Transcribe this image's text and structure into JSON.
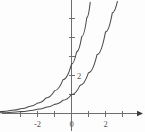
{
  "figure": {
    "title": "",
    "background_color": "#fdfdfd",
    "width": 145,
    "height": 132
  },
  "colors": {
    "axis": "#6e6e6e",
    "curve": "#4a4a4a",
    "label": "#555555",
    "arrow": "#3c3c3c"
  },
  "chart_data": {
    "type": "line",
    "title": "",
    "xlabel": "",
    "ylabel": "",
    "grid": false,
    "legend": "none",
    "xlim": [
      -4.2,
      4.3
    ],
    "ylim": [
      -0.95,
      5.95
    ],
    "x_ticks": [
      -3,
      -2,
      -1,
      0,
      1,
      2,
      3
    ],
    "x_tick_labels": [
      "",
      "-2",
      "",
      "0",
      "",
      "2",
      ""
    ],
    "y_ticks": [
      1,
      2,
      3,
      4,
      5
    ],
    "y_tick_labels": [
      "",
      "2",
      "",
      "",
      ""
    ],
    "x_axis_arrow": true,
    "y_axis_arrow": false,
    "asymptote": 0,
    "series": [
      {
        "name": "curve-left",
        "description": "steeper exponential curve",
        "y_intercept": 2.6,
        "x": [
          -4.2,
          -3.5,
          -3.0,
          -2.5,
          -2.0,
          -1.5,
          -1.0,
          -0.5,
          0.0,
          0.3,
          0.6,
          0.9,
          1.1
        ],
        "values": [
          0.1,
          0.17,
          0.25,
          0.37,
          0.55,
          0.82,
          1.2,
          1.78,
          2.6,
          3.25,
          4.05,
          5.05,
          5.85
        ]
      },
      {
        "name": "curve-right",
        "description": "shallower exponential curve",
        "y_intercept": 1.0,
        "x": [
          -4.2,
          -3.5,
          -3.0,
          -2.5,
          -2.0,
          -1.5,
          -1.0,
          -0.5,
          0.0,
          0.5,
          1.0,
          1.5,
          2.0,
          2.4,
          2.7
        ],
        "values": [
          0.04,
          0.07,
          0.1,
          0.15,
          0.22,
          0.33,
          0.48,
          0.7,
          1.0,
          1.48,
          2.15,
          3.1,
          4.3,
          5.3,
          5.9
        ]
      }
    ]
  },
  "labels": {
    "x_neg2": "-2",
    "x_zero": "0",
    "x_pos2": "2",
    "y_two": "2"
  }
}
